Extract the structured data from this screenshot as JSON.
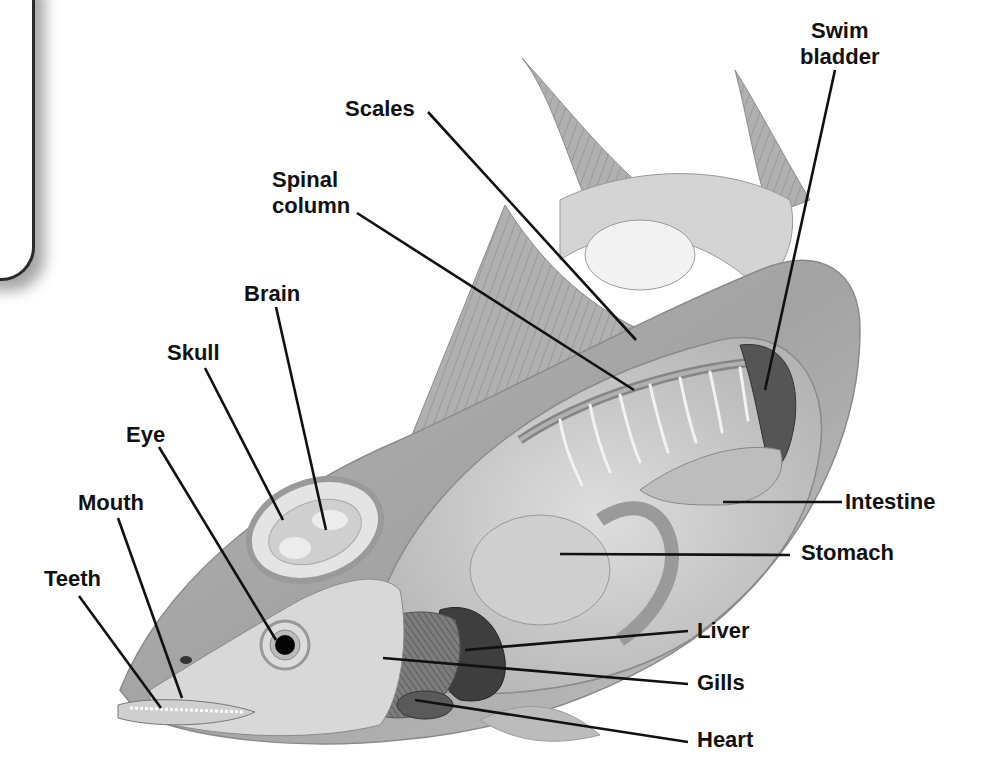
{
  "diagram": {
    "labels": [
      {
        "id": "swim-bladder",
        "text": "Swim bladder",
        "line1": "Swim",
        "line2": "bladder",
        "x": 800,
        "y": 18,
        "align": "center",
        "leader": [
          [
            835,
            70
          ],
          [
            765,
            390
          ]
        ]
      },
      {
        "id": "scales",
        "text": "Scales",
        "line1": "Scales",
        "x": 345,
        "y": 96,
        "leader": [
          [
            428,
            112
          ],
          [
            636,
            340
          ]
        ]
      },
      {
        "id": "spinal-column",
        "text": "Spinal column",
        "line1": "Spinal",
        "line2": "column",
        "x": 272,
        "y": 167,
        "leader": [
          [
            357,
            213
          ],
          [
            634,
            390
          ]
        ]
      },
      {
        "id": "brain",
        "text": "Brain",
        "line1": "Brain",
        "x": 244,
        "y": 281,
        "leader": [
          [
            276,
            307
          ],
          [
            326,
            530
          ]
        ]
      },
      {
        "id": "skull",
        "text": "Skull",
        "line1": "Skull",
        "x": 167,
        "y": 340,
        "leader": [
          [
            205,
            368
          ],
          [
            283,
            520
          ]
        ]
      },
      {
        "id": "eye",
        "text": "Eye",
        "line1": "Eye",
        "x": 126,
        "y": 422,
        "leader": [
          [
            159,
            447
          ],
          [
            276,
            640
          ]
        ]
      },
      {
        "id": "mouth",
        "text": "Mouth",
        "line1": "Mouth",
        "x": 78,
        "y": 490,
        "leader": [
          [
            118,
            518
          ],
          [
            182,
            698
          ]
        ]
      },
      {
        "id": "teeth",
        "text": "Teeth",
        "line1": "Teeth",
        "x": 44,
        "y": 566,
        "leader": [
          [
            79,
            596
          ],
          [
            161,
            708
          ]
        ]
      },
      {
        "id": "intestine",
        "text": "Intestine",
        "line1": "Intestine",
        "x": 845,
        "y": 489,
        "leader": [
          [
            842,
            502
          ],
          [
            723,
            502
          ]
        ]
      },
      {
        "id": "stomach",
        "text": "Stomach",
        "line1": "Stomach",
        "x": 801,
        "y": 540,
        "leader": [
          [
            790,
            555
          ],
          [
            560,
            554
          ]
        ]
      },
      {
        "id": "liver",
        "text": "Liver",
        "line1": "Liver",
        "x": 697,
        "y": 618,
        "leader": [
          [
            688,
            631
          ],
          [
            465,
            650
          ]
        ]
      },
      {
        "id": "gills",
        "text": "Gills",
        "line1": "Gills",
        "x": 697,
        "y": 670,
        "leader": [
          [
            688,
            684
          ],
          [
            383,
            658
          ]
        ]
      },
      {
        "id": "heart",
        "text": "Heart",
        "line1": "Heart",
        "x": 697,
        "y": 727,
        "leader": [
          [
            688,
            742
          ],
          [
            415,
            700
          ]
        ]
      }
    ]
  },
  "colors": {
    "label_text": "#111111",
    "leader_line": "#111111",
    "body_light": "#c9c9c9",
    "body_mid": "#a9a9a9",
    "body_dark": "#7c7c7c",
    "organ_dark": "#3a3a3a"
  }
}
